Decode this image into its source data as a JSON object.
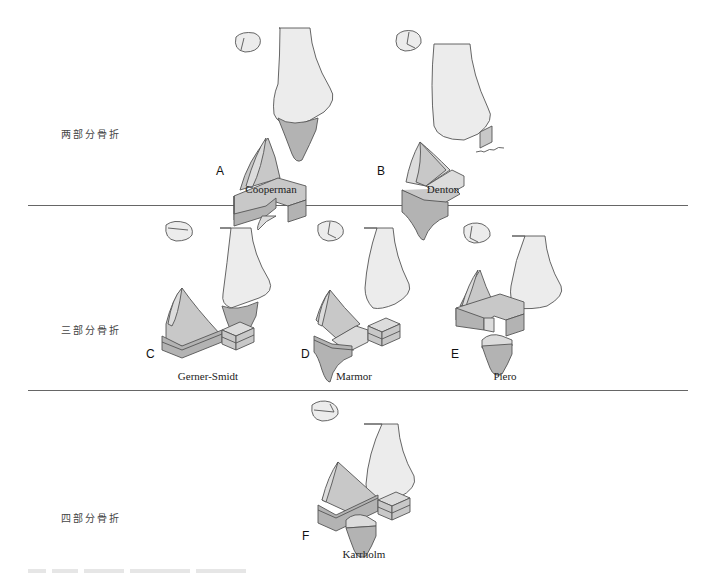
{
  "figure": {
    "rows": [
      {
        "label": "两部分骨折",
        "panels": [
          {
            "letter": "A",
            "name": "Cooperman"
          },
          {
            "letter": "B",
            "name": "Denton"
          }
        ]
      },
      {
        "label": "三部分骨折",
        "panels": [
          {
            "letter": "C",
            "name": "Gerner-Smidt"
          },
          {
            "letter": "D",
            "name": "Marmor"
          },
          {
            "letter": "E",
            "name": "Piero"
          }
        ]
      },
      {
        "label": "四部分骨折",
        "panels": [
          {
            "letter": "F",
            "name": "Karrholm"
          }
        ]
      }
    ],
    "colors": {
      "bone_fill": "#ececec",
      "fragment_dark": "#b3b3b3",
      "fragment_mid": "#c8c8c8",
      "outline": "#555555",
      "separator": "#666666"
    }
  }
}
